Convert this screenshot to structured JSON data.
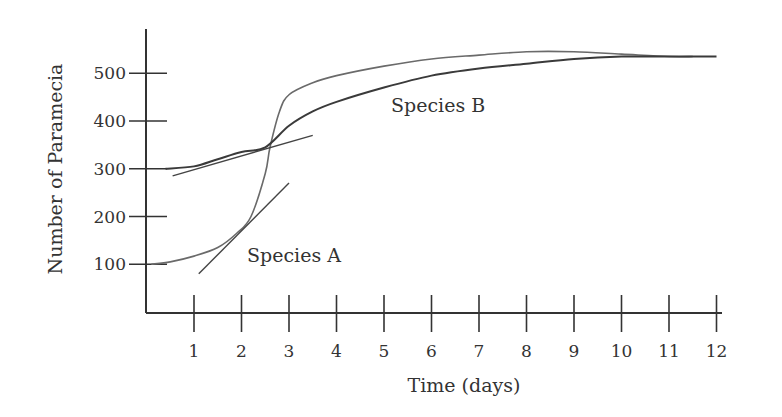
{
  "chart_data": {
    "type": "line",
    "title": "",
    "xlabel": "Time (days)",
    "ylabel": "Number of Paramecia",
    "xlim": [
      0,
      12.5
    ],
    "ylim": [
      0,
      550
    ],
    "grid": false,
    "legend": "inline labels",
    "x_ticks": [
      1,
      2,
      3,
      4,
      5,
      6,
      7,
      8,
      9,
      10,
      11,
      12
    ],
    "x_tick_labels": [
      "1",
      "2",
      "3",
      "4",
      "5",
      "6",
      "7",
      "8",
      "9",
      "10",
      "11",
      "12"
    ],
    "y_ticks": [
      100,
      200,
      300,
      400,
      500
    ],
    "y_tick_labels": [
      "100",
      "200",
      "300",
      "400",
      "500"
    ],
    "series": [
      {
        "name": "Species A",
        "x": [
          0.1,
          0.5,
          1,
          1.5,
          1.9,
          2.2,
          2.5,
          2.6,
          2.8,
          3,
          3.5,
          4,
          5,
          6,
          7,
          8,
          9,
          10,
          11,
          11.5
        ],
        "values": [
          100,
          105,
          117,
          135,
          165,
          200,
          290,
          345,
          420,
          455,
          480,
          495,
          515,
          530,
          538,
          545,
          545,
          540,
          535,
          535
        ]
      },
      {
        "name": "Species B",
        "x": [
          0.4,
          1,
          1.5,
          2,
          2.5,
          3,
          3.5,
          4,
          5,
          6,
          7,
          8,
          9,
          10,
          11,
          12
        ],
        "values": [
          300,
          305,
          320,
          335,
          345,
          390,
          420,
          440,
          470,
          495,
          510,
          520,
          530,
          535,
          535,
          535
        ]
      }
    ],
    "annotations": [
      {
        "type": "tangent-line",
        "series": "Species A",
        "from": [
          1.1,
          80
        ],
        "to": [
          3.0,
          270
        ]
      },
      {
        "type": "tangent-line",
        "series": "Species B",
        "from": [
          0.55,
          285
        ],
        "to": [
          3.5,
          370
        ]
      },
      {
        "type": "label",
        "text": "Species A",
        "at": [
          2.3,
          130
        ]
      },
      {
        "type": "label",
        "text": "Species B",
        "at": [
          5.2,
          435
        ]
      }
    ]
  },
  "labels": {
    "series_a": "Species A",
    "series_b": "Species B",
    "xlabel": "Time (days)",
    "ylabel": "Number of Paramecia"
  }
}
